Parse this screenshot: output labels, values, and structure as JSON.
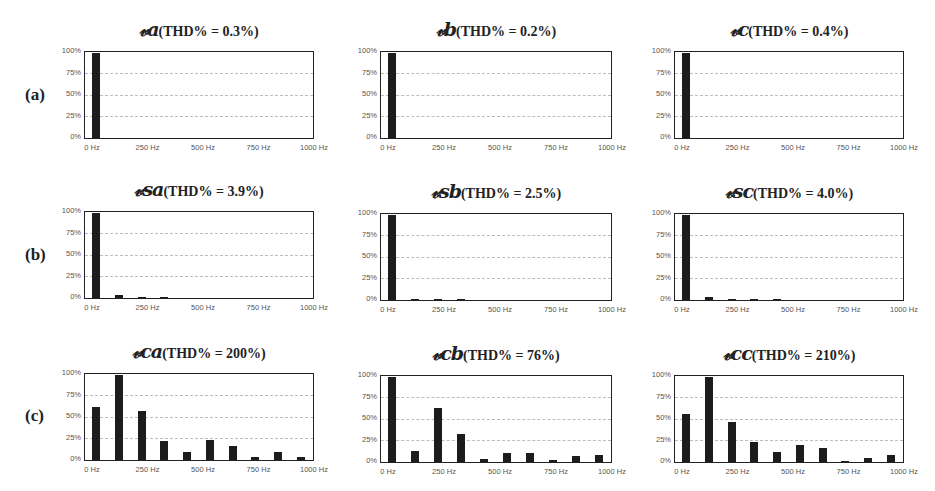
{
  "row_labels": [
    "(a)",
    "(b)",
    "(c)"
  ],
  "y_ticks": [
    "100%",
    "75%",
    "50%",
    "25%",
    "0%"
  ],
  "x_ticks": [
    "0 Hz",
    "250 Hz",
    "500 Hz",
    "750 Hz",
    "1000 Hz"
  ],
  "panels": [
    {
      "sym": "𝓋a",
      "rest": "(THD% = 0.3%)"
    },
    {
      "sym": "𝓋b",
      "rest": "(THD% = 0.2%)"
    },
    {
      "sym": "𝓋c",
      "rest": "(THD% = 0.4%)"
    },
    {
      "sym": "𝓋sa",
      "rest": "(THD% = 3.9%)"
    },
    {
      "sym": "𝓋sb",
      "rest": "(THD% = 2.5%)"
    },
    {
      "sym": "𝓋sc",
      "rest": "(THD% = 4.0%)"
    },
    {
      "sym": "𝓋ca",
      "rest": "(THD% = 200%)"
    },
    {
      "sym": "𝓋cb",
      "rest": "(THD% = 76%)"
    },
    {
      "sym": "𝓋cc",
      "rest": "(THD% = 210%)"
    }
  ],
  "chart_data": [
    {
      "type": "bar",
      "title": "va (THD% = 0.3%)",
      "row": "(a)",
      "x": [
        50,
        150,
        250,
        350,
        450,
        550,
        650,
        750,
        850,
        950
      ],
      "values": [
        100,
        0,
        0,
        0,
        0,
        0,
        0,
        0,
        0,
        0
      ],
      "xlabel": "Frequency",
      "ylabel": "Magnitude (% of max)",
      "xlim": [
        0,
        1000
      ],
      "ylim": [
        0,
        100
      ],
      "grid": true
    },
    {
      "type": "bar",
      "title": "vb (THD% = 0.2%)",
      "row": "(a)",
      "x": [
        50,
        150,
        250,
        350,
        450,
        550,
        650,
        750,
        850,
        950
      ],
      "values": [
        100,
        0,
        0,
        0,
        0,
        0,
        0,
        0,
        0,
        0
      ],
      "xlim": [
        0,
        1000
      ],
      "ylim": [
        0,
        100
      ],
      "grid": true
    },
    {
      "type": "bar",
      "title": "vc (THD% = 0.4%)",
      "row": "(a)",
      "x": [
        50,
        150,
        250,
        350,
        450,
        550,
        650,
        750,
        850,
        950
      ],
      "values": [
        100,
        0,
        0,
        0,
        0,
        0,
        0,
        0,
        0,
        0
      ],
      "xlim": [
        0,
        1000
      ],
      "ylim": [
        0,
        100
      ],
      "grid": true
    },
    {
      "type": "bar",
      "title": "vsa (THD% = 3.9%)",
      "row": "(b)",
      "x": [
        50,
        150,
        250,
        350,
        450,
        550,
        650,
        750,
        850,
        950
      ],
      "values": [
        100,
        3,
        1.5,
        0.5,
        0,
        0,
        0,
        0,
        0,
        0
      ],
      "xlim": [
        0,
        1000
      ],
      "ylim": [
        0,
        100
      ],
      "grid": true
    },
    {
      "type": "bar",
      "title": "vsb (THD% = 2.5%)",
      "row": "(b)",
      "x": [
        50,
        150,
        250,
        350,
        450,
        550,
        650,
        750,
        850,
        950
      ],
      "values": [
        100,
        0.5,
        1.5,
        1,
        0,
        0,
        0,
        0,
        0,
        0
      ],
      "xlim": [
        0,
        1000
      ],
      "ylim": [
        0,
        100
      ],
      "grid": true
    },
    {
      "type": "bar",
      "title": "vsc (THD% = 4.0%)",
      "row": "(b)",
      "x": [
        50,
        150,
        250,
        350,
        450,
        550,
        650,
        750,
        850,
        950
      ],
      "values": [
        100,
        3,
        1.5,
        0.3,
        0.3,
        0,
        0,
        0,
        0,
        0
      ],
      "xlim": [
        0,
        1000
      ],
      "ylim": [
        0,
        100
      ],
      "grid": true
    },
    {
      "type": "bar",
      "title": "vca (THD% = 200%)",
      "row": "(c)",
      "x": [
        50,
        150,
        250,
        350,
        450,
        550,
        650,
        750,
        850,
        950
      ],
      "values": [
        62,
        100,
        58,
        22,
        10,
        24,
        17,
        4,
        9,
        3
      ],
      "xlim": [
        0,
        1000
      ],
      "ylim": [
        0,
        100
      ],
      "grid": true
    },
    {
      "type": "bar",
      "title": "vcb (THD% = 76%)",
      "row": "(c)",
      "x": [
        50,
        150,
        250,
        350,
        450,
        550,
        650,
        750,
        850,
        950
      ],
      "values": [
        100,
        13,
        64,
        33,
        3,
        11,
        11,
        2,
        7,
        8
      ],
      "xlim": [
        0,
        1000
      ],
      "ylim": [
        0,
        100
      ],
      "grid": true
    },
    {
      "type": "bar",
      "title": "vcc (THD% = 210%)",
      "row": "(c)",
      "x": [
        50,
        150,
        250,
        350,
        450,
        550,
        650,
        750,
        850,
        950
      ],
      "values": [
        56,
        100,
        47,
        23,
        12,
        20,
        17,
        1,
        5,
        8
      ],
      "xlim": [
        0,
        1000
      ],
      "ylim": [
        0,
        100
      ],
      "grid": true
    }
  ]
}
